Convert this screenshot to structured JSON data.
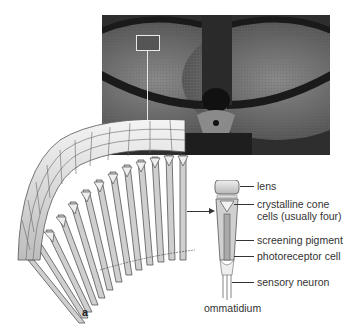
{
  "figure": {
    "panel_label": "a",
    "photo": {
      "subject": "compound-eye-micrograph",
      "highlight_box": true
    },
    "fan_diagram": {
      "subject": "ommatidia-array"
    },
    "ommatidium": {
      "caption": "ommatidium",
      "labels": [
        {
          "id": "lens",
          "text": "lens"
        },
        {
          "id": "cone-1",
          "text": "crystalline cone"
        },
        {
          "id": "cone-2",
          "text": "cells (usually four)"
        },
        {
          "id": "pigment",
          "text": "screening pigment"
        },
        {
          "id": "photoreceptor",
          "text": "photoreceptor cell"
        },
        {
          "id": "neuron",
          "text": "sensory neuron"
        }
      ]
    },
    "colors": {
      "photo_bg": "#3a3a3a",
      "lines": "#333333",
      "cell_fill": "#d8d8d8"
    }
  }
}
